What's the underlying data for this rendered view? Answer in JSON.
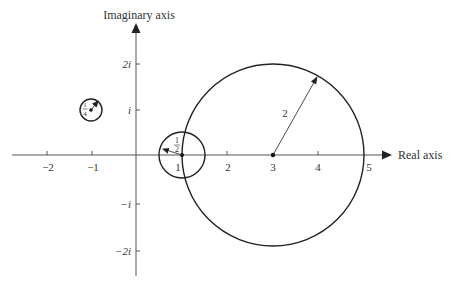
{
  "diagram": {
    "type": "complex-plane-circles",
    "colors": {
      "ink": "#222222",
      "axis": "#555555",
      "text": "#333333",
      "background": "#ffffff"
    },
    "axes": {
      "x_title": "Real axis",
      "y_title": "Imaginary axis",
      "x_ticks": [
        {
          "value": -2,
          "label": "−2"
        },
        {
          "value": -1,
          "label": "−1"
        },
        {
          "value": 1,
          "label": "1"
        },
        {
          "value": 2,
          "label": "2"
        },
        {
          "value": 3,
          "label": "3"
        },
        {
          "value": 4,
          "label": "4"
        },
        {
          "value": 5,
          "label": "5"
        }
      ],
      "y_ticks": [
        {
          "value": 2,
          "label": "2i"
        },
        {
          "value": 1,
          "label": "i"
        },
        {
          "value": -1,
          "label": "−i"
        },
        {
          "value": -2,
          "label": "−2i"
        }
      ]
    },
    "circles": [
      {
        "name": "circle-center-3",
        "center": [
          3,
          0
        ],
        "radius": 2,
        "radius_label": "2"
      },
      {
        "name": "circle-center-1",
        "center": [
          1,
          0
        ],
        "radius": 0.5,
        "radius_label_num": "1",
        "radius_label_den": "2"
      },
      {
        "name": "circle-center-minus1-plus-i",
        "center": [
          -1,
          1
        ],
        "radius": 0.25,
        "radius_label_num": "1",
        "radius_label_den": "4"
      }
    ]
  }
}
